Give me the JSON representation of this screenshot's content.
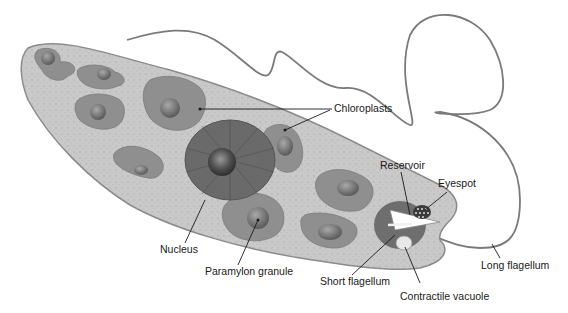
{
  "diagram": {
    "colors": {
      "background": "#ffffff",
      "cytoplasm": "#c9c9c9",
      "cell_outline": "#8a8a8a",
      "chloroplast": "#8f8f8f",
      "pyrenoid": "#6e6e6e",
      "nucleus_envelope": "#6a6a6a",
      "nucleolus": "#4a4a4a",
      "flagellum": "#7a7a7a",
      "label_text": "#1a1a1a"
    },
    "labels": {
      "chloroplasts": "Chloroplasts",
      "reservoir": "Reservoir",
      "eyespot": "Eyespot",
      "nucleus": "Nucleus",
      "paramylon_granule": "Paramylon granule",
      "short_flagellum": "Short flagellum",
      "contractile_vacuole": "Contractile vacuole",
      "long_flagellum": "Long flagellum"
    }
  }
}
